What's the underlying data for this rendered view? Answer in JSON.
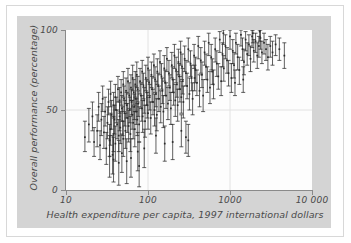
{
  "chart_data": {
    "type": "scatter",
    "title": "",
    "xlabel": "Health expenditure per capita, 1997 international dollars",
    "ylabel": "Overall performance (percentage)",
    "xscale": "log",
    "yscale": "linear",
    "xlim": [
      10,
      10000
    ],
    "ylim": [
      0,
      100
    ],
    "xticks": [
      10,
      100,
      1000,
      10000
    ],
    "xticklabels": [
      "10",
      "100",
      "1000",
      "10 000"
    ],
    "yticks": [
      0,
      50,
      100
    ],
    "yticklabels": [
      "0",
      "50",
      "100"
    ],
    "grid": "xy-light",
    "legend": "none",
    "marker": "error-bar-i-beam",
    "point_color": "#2b2b2b",
    "panel_color": "#d4d4d4",
    "plot_bg_color": "#fdfdfd",
    "axis_color": "#8a8a8a",
    "grid_color": "#e2e2e2",
    "n_points": 191,
    "note": "Each point is a country: marker at estimated overall performance with vertical uncertainty interval (I-beam caps).",
    "points": [
      [
        17,
        33,
        24,
        43
      ],
      [
        19,
        41,
        30,
        51
      ],
      [
        21,
        46,
        37,
        55
      ],
      [
        22,
        30,
        21,
        39
      ],
      [
        24,
        37,
        27,
        47
      ],
      [
        25,
        52,
        43,
        61
      ],
      [
        26,
        28,
        19,
        37
      ],
      [
        27,
        44,
        34,
        54
      ],
      [
        28,
        57,
        49,
        65
      ],
      [
        29,
        36,
        26,
        46
      ],
      [
        30,
        49,
        40,
        58
      ],
      [
        31,
        26,
        16,
        36
      ],
      [
        32,
        42,
        32,
        52
      ],
      [
        33,
        55,
        47,
        63
      ],
      [
        34,
        31,
        21,
        41
      ],
      [
        35,
        60,
        52,
        68
      ],
      [
        35,
        38,
        28,
        48
      ],
      [
        36,
        47,
        38,
        56
      ],
      [
        37,
        22,
        10,
        34
      ],
      [
        38,
        53,
        45,
        61
      ],
      [
        38,
        35,
        24,
        46
      ],
      [
        39,
        44,
        35,
        53
      ],
      [
        40,
        58,
        50,
        66
      ],
      [
        40,
        29,
        18,
        40
      ],
      [
        41,
        50,
        42,
        58
      ],
      [
        42,
        41,
        32,
        50
      ],
      [
        43,
        63,
        55,
        71
      ],
      [
        44,
        34,
        24,
        44
      ],
      [
        45,
        56,
        48,
        64
      ],
      [
        45,
        46,
        37,
        55
      ],
      [
        46,
        39,
        29,
        49
      ],
      [
        47,
        61,
        53,
        69
      ],
      [
        48,
        51,
        43,
        59
      ],
      [
        49,
        43,
        34,
        52
      ],
      [
        50,
        66,
        58,
        74
      ],
      [
        50,
        32,
        21,
        43
      ],
      [
        51,
        57,
        49,
        65
      ],
      [
        52,
        48,
        40,
        56
      ],
      [
        53,
        37,
        26,
        48
      ],
      [
        54,
        62,
        54,
        70
      ],
      [
        55,
        53,
        45,
        61
      ],
      [
        56,
        45,
        36,
        54
      ],
      [
        57,
        68,
        60,
        76
      ],
      [
        58,
        40,
        30,
        50
      ],
      [
        59,
        59,
        51,
        67
      ],
      [
        60,
        50,
        42,
        58
      ],
      [
        61,
        35,
        24,
        46
      ],
      [
        62,
        64,
        56,
        72
      ],
      [
        63,
        55,
        47,
        63
      ],
      [
        64,
        47,
        38,
        56
      ],
      [
        65,
        70,
        62,
        78
      ],
      [
        66,
        42,
        32,
        52
      ],
      [
        67,
        61,
        53,
        69
      ],
      [
        68,
        52,
        44,
        60
      ],
      [
        69,
        38,
        27,
        49
      ],
      [
        70,
        66,
        58,
        74
      ],
      [
        71,
        57,
        49,
        65
      ],
      [
        72,
        49,
        41,
        57
      ],
      [
        73,
        72,
        64,
        80
      ],
      [
        74,
        44,
        34,
        54
      ],
      [
        75,
        63,
        55,
        71
      ],
      [
        76,
        54,
        46,
        62
      ],
      [
        78,
        41,
        30,
        52
      ],
      [
        80,
        68,
        60,
        76
      ],
      [
        82,
        59,
        51,
        67
      ],
      [
        84,
        51,
        43,
        59
      ],
      [
        85,
        74,
        66,
        81
      ],
      [
        86,
        46,
        36,
        56
      ],
      [
        88,
        65,
        57,
        73
      ],
      [
        90,
        56,
        48,
        64
      ],
      [
        92,
        43,
        33,
        53
      ],
      [
        94,
        70,
        62,
        78
      ],
      [
        96,
        61,
        53,
        69
      ],
      [
        98,
        53,
        45,
        61
      ],
      [
        100,
        76,
        68,
        83
      ],
      [
        100,
        48,
        38,
        58
      ],
      [
        103,
        67,
        59,
        75
      ],
      [
        105,
        58,
        50,
        66
      ],
      [
        108,
        45,
        35,
        55
      ],
      [
        110,
        72,
        64,
        80
      ],
      [
        112,
        63,
        55,
        71
      ],
      [
        115,
        55,
        47,
        63
      ],
      [
        118,
        78,
        70,
        85
      ],
      [
        120,
        50,
        40,
        60
      ],
      [
        122,
        69,
        61,
        77
      ],
      [
        125,
        60,
        52,
        68
      ],
      [
        128,
        47,
        37,
        57
      ],
      [
        130,
        74,
        66,
        82
      ],
      [
        133,
        65,
        57,
        73
      ],
      [
        136,
        57,
        49,
        65
      ],
      [
        140,
        80,
        72,
        87
      ],
      [
        143,
        52,
        42,
        62
      ],
      [
        146,
        71,
        63,
        79
      ],
      [
        150,
        62,
        54,
        70
      ],
      [
        154,
        49,
        39,
        59
      ],
      [
        158,
        76,
        68,
        84
      ],
      [
        162,
        67,
        59,
        75
      ],
      [
        166,
        59,
        51,
        67
      ],
      [
        170,
        82,
        74,
        89
      ],
      [
        175,
        54,
        44,
        64
      ],
      [
        180,
        73,
        65,
        81
      ],
      [
        185,
        64,
        56,
        72
      ],
      [
        190,
        51,
        41,
        61
      ],
      [
        195,
        78,
        70,
        86
      ],
      [
        200,
        69,
        61,
        77
      ],
      [
        205,
        61,
        53,
        69
      ],
      [
        210,
        84,
        76,
        91
      ],
      [
        215,
        56,
        46,
        66
      ],
      [
        220,
        75,
        67,
        83
      ],
      [
        225,
        66,
        58,
        74
      ],
      [
        230,
        53,
        43,
        63
      ],
      [
        235,
        80,
        72,
        88
      ],
      [
        240,
        71,
        63,
        79
      ],
      [
        245,
        63,
        55,
        71
      ],
      [
        250,
        86,
        78,
        93
      ],
      [
        255,
        58,
        48,
        68
      ],
      [
        260,
        77,
        69,
        85
      ],
      [
        265,
        68,
        60,
        76
      ],
      [
        270,
        55,
        45,
        65
      ],
      [
        280,
        82,
        74,
        90
      ],
      [
        290,
        73,
        65,
        81
      ],
      [
        300,
        65,
        57,
        73
      ],
      [
        310,
        88,
        80,
        95
      ],
      [
        320,
        60,
        50,
        70
      ],
      [
        330,
        79,
        71,
        87
      ],
      [
        340,
        70,
        62,
        78
      ],
      [
        350,
        57,
        47,
        67
      ],
      [
        365,
        84,
        76,
        91
      ],
      [
        380,
        75,
        67,
        83
      ],
      [
        395,
        67,
        59,
        75
      ],
      [
        410,
        90,
        82,
        96
      ],
      [
        425,
        62,
        52,
        72
      ],
      [
        440,
        81,
        73,
        89
      ],
      [
        455,
        72,
        64,
        80
      ],
      [
        470,
        59,
        49,
        69
      ],
      [
        490,
        86,
        78,
        93
      ],
      [
        510,
        77,
        69,
        85
      ],
      [
        530,
        69,
        61,
        77
      ],
      [
        550,
        92,
        84,
        98
      ],
      [
        570,
        64,
        54,
        74
      ],
      [
        590,
        83,
        75,
        91
      ],
      [
        610,
        74,
        66,
        82
      ],
      [
        630,
        66,
        57,
        75
      ],
      [
        660,
        88,
        80,
        95
      ],
      [
        690,
        79,
        71,
        87
      ],
      [
        720,
        71,
        63,
        79
      ],
      [
        750,
        94,
        86,
        99
      ],
      [
        780,
        68,
        59,
        77
      ],
      [
        810,
        85,
        77,
        92
      ],
      [
        840,
        76,
        68,
        84
      ],
      [
        880,
        90,
        82,
        97
      ],
      [
        920,
        81,
        73,
        89
      ],
      [
        960,
        73,
        65,
        81
      ],
      [
        1000,
        96,
        88,
        100
      ],
      [
        1040,
        70,
        61,
        79
      ],
      [
        1080,
        87,
        79,
        94
      ],
      [
        1120,
        78,
        70,
        86
      ],
      [
        1180,
        92,
        85,
        98
      ],
      [
        1240,
        83,
        75,
        91
      ],
      [
        1300,
        75,
        66,
        83
      ],
      [
        1360,
        97,
        90,
        100
      ],
      [
        1420,
        88,
        81,
        95
      ],
      [
        1480,
        80,
        72,
        88
      ],
      [
        1550,
        94,
        87,
        99
      ],
      [
        1620,
        85,
        78,
        92
      ],
      [
        1700,
        91,
        84,
        97
      ],
      [
        1780,
        82,
        74,
        90
      ],
      [
        1860,
        96,
        89,
        100
      ],
      [
        1950,
        87,
        80,
        94
      ],
      [
        2050,
        93,
        86,
        98
      ],
      [
        2150,
        84,
        76,
        92
      ],
      [
        2250,
        90,
        83,
        96
      ],
      [
        2350,
        95,
        88,
        100
      ],
      [
        2450,
        86,
        79,
        93
      ],
      [
        2600,
        92,
        85,
        98
      ],
      [
        2750,
        88,
        81,
        94
      ],
      [
        2900,
        83,
        75,
        91
      ],
      [
        3100,
        90,
        83,
        96
      ],
      [
        3300,
        86,
        78,
        93
      ],
      [
        3600,
        91,
        84,
        97
      ],
      [
        4000,
        88,
        81,
        95
      ],
      [
        4600,
        84,
        76,
        92
      ],
      [
        1150,
        67,
        59,
        75
      ],
      [
        1450,
        69,
        61,
        77
      ],
      [
        370,
        70,
        62,
        78
      ],
      [
        290,
        33,
        23,
        43
      ],
      [
        310,
        31,
        21,
        41
      ],
      [
        255,
        37,
        27,
        47
      ],
      [
        200,
        30,
        19,
        41
      ],
      [
        160,
        29,
        18,
        40
      ],
      [
        125,
        34,
        23,
        45
      ],
      [
        90,
        26,
        14,
        38
      ],
      [
        75,
        24,
        12,
        36
      ],
      [
        62,
        20,
        8,
        32
      ],
      [
        55,
        18,
        4,
        32
      ],
      [
        48,
        23,
        11,
        35
      ],
      [
        44,
        17,
        3,
        31
      ],
      [
        78,
        15,
        2,
        30
      ],
      [
        38,
        19,
        5,
        33
      ],
      [
        34,
        21,
        8,
        34
      ],
      [
        2300,
        99,
        93,
        100
      ],
      [
        1900,
        98,
        92,
        100
      ],
      [
        830,
        98,
        91,
        100
      ]
    ]
  }
}
